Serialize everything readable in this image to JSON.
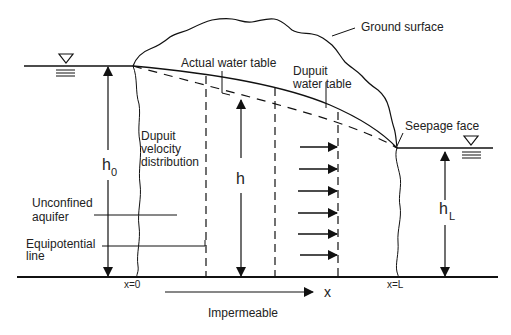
{
  "diagram": {
    "labels": {
      "ground_surface": "Ground surface",
      "actual_water_table": "Actual water table",
      "dupuit_water_table_line1": "Dupuit",
      "dupuit_water_table_line2": "water table",
      "seepage_face": "Seepage face",
      "dupuit_velocity_line1": "Dupuit",
      "dupuit_velocity_line2": "velocity",
      "dupuit_velocity_line3": "distribution",
      "unconfined_aquifer_line1": "Unconfined",
      "unconfined_aquifer_line2": "aquifer",
      "equipotential_line1": "Equipotential",
      "equipotential_line2": "line",
      "h0_main": "h",
      "h0_sub": "0",
      "h_main": "h",
      "hL_main": "h",
      "hL_sub": "L",
      "x_origin": "x=0",
      "x_end": "x=L",
      "x_axis": "x",
      "impermeable": "Impermeable"
    },
    "symbols": {
      "water_level_left": "water-level-triangle",
      "water_level_right": "water-level-triangle"
    },
    "velocity_arrow_count": 6,
    "colors": {
      "line": "#111111",
      "text": "#222222",
      "background": "#ffffff"
    }
  }
}
